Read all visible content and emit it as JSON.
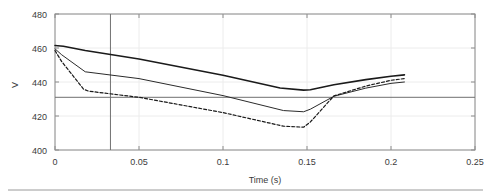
{
  "chart_data": {
    "type": "line",
    "title": "",
    "xlabel": "Time (s)",
    "ylabel": "V",
    "xlim": [
      0,
      0.25
    ],
    "ylim": [
      400,
      480
    ],
    "xticks": [
      0,
      0.05,
      0.1,
      0.15,
      0.2,
      0.25
    ],
    "xtick_labels": [
      "0",
      "0.05",
      "0.1",
      "0.15",
      "0.2",
      "0.25"
    ],
    "yticks": [
      400,
      420,
      440,
      460,
      480
    ],
    "ytick_labels": [
      "400",
      "420",
      "440",
      "460",
      "480"
    ],
    "grid": true,
    "legend": "none",
    "annotations": {
      "horizontal_reference_line": 431,
      "vertical_cursor_line": 0.033
    },
    "series": [
      {
        "name": "upper-solid-thick",
        "style": "solid",
        "width": 1.6,
        "color": "#1a1a1a",
        "x": [
          0,
          0.005,
          0.018,
          0.05,
          0.1,
          0.134,
          0.148,
          0.152,
          0.166,
          0.185,
          0.2,
          0.208
        ],
        "y": [
          461.5,
          461.0,
          458.5,
          453.5,
          444.0,
          436.5,
          435.2,
          435.4,
          438.4,
          441.4,
          443.4,
          444.2
        ]
      },
      {
        "name": "middle-solid-thin",
        "style": "solid",
        "width": 1.0,
        "color": "#2b2b2b",
        "x": [
          0,
          0.004,
          0.018,
          0.05,
          0.1,
          0.136,
          0.148,
          0.152,
          0.166,
          0.185,
          0.2,
          0.208
        ],
        "y": [
          459.5,
          456.0,
          446.0,
          442.0,
          432.0,
          423.2,
          422.5,
          424.0,
          431.6,
          436.4,
          439.2,
          440.0
        ]
      },
      {
        "name": "lower-dashed",
        "style": "dashed",
        "width": 1.2,
        "color": "#1a1a1a",
        "x": [
          0,
          0.004,
          0.017,
          0.02,
          0.05,
          0.1,
          0.136,
          0.148,
          0.152,
          0.166,
          0.185,
          0.2,
          0.208
        ],
        "y": [
          458.5,
          452.0,
          435.8,
          434.6,
          431.0,
          422.0,
          414.0,
          413.4,
          416.5,
          431.8,
          437.6,
          441.0,
          442.0
        ]
      }
    ]
  },
  "axes": {
    "ylabel_text": "V",
    "xlabel_text": "Time (s)"
  }
}
